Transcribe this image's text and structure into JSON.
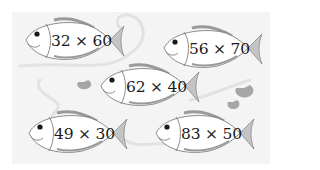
{
  "colors": {
    "background": "#ffffff",
    "panel": "#f4f4f4",
    "fish_body": "#ffffff",
    "fish_outline": "#6e6e6e",
    "fin": "#a9a9a9",
    "lily_pad": "#a6a6a6",
    "text": "#1a1a1a"
  },
  "fish": [
    {
      "expression": "32 × 60",
      "a": 32,
      "b": 60,
      "operator": "×"
    },
    {
      "expression": "56 × 70",
      "a": 56,
      "b": 70,
      "operator": "×"
    },
    {
      "expression": "62 × 40",
      "a": 62,
      "b": 40,
      "operator": "×"
    },
    {
      "expression": "49 × 30",
      "a": 49,
      "b": 30,
      "operator": "×"
    },
    {
      "expression": "83 × 50",
      "a": 83,
      "b": 50,
      "operator": "×"
    }
  ]
}
